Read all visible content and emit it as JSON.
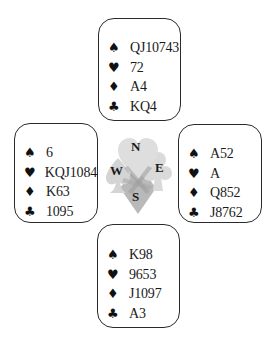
{
  "diagram": {
    "type": "bridge-deal",
    "suit_icons": {
      "spades": "♠",
      "hearts": "♥",
      "diamonds": "♦",
      "clubs": "♣"
    },
    "compass": {
      "north": "N",
      "west": "W",
      "east": "E",
      "south": "S",
      "fill_colors": {
        "heart": "#d9d9d9",
        "spade": "#d6d6d6",
        "club": "#dcdcdc",
        "diamond": "#b8b8b8"
      }
    },
    "hands": {
      "north": {
        "spades": "QJ10743",
        "hearts": "72",
        "diamonds": "A4",
        "clubs": "KQ4"
      },
      "west": {
        "spades": "6",
        "hearts": "KQJ1084",
        "diamonds": "K63",
        "clubs": "1095"
      },
      "east": {
        "spades": "A52",
        "hearts": "A",
        "diamonds": "Q852",
        "clubs": "J8762"
      },
      "south": {
        "spades": "K98",
        "hearts": "9653",
        "diamonds": "J1097",
        "clubs": "A3"
      }
    }
  }
}
